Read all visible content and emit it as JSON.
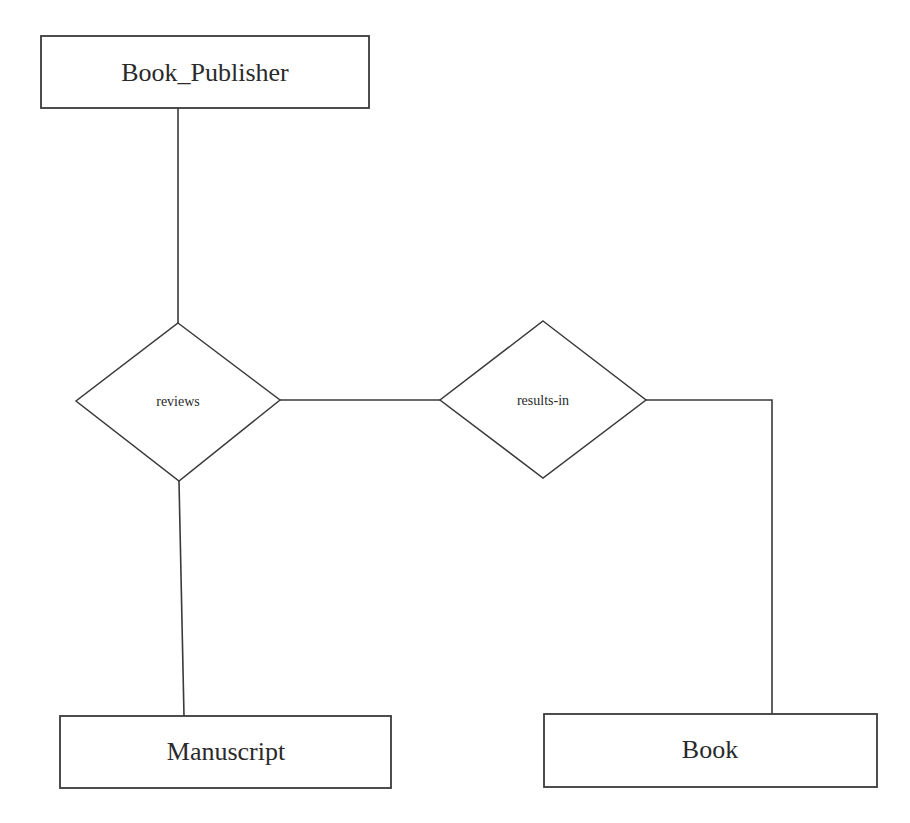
{
  "diagram": {
    "type": "er-diagram",
    "entities": [
      {
        "id": "book_publisher",
        "label": "Book_Publisher"
      },
      {
        "id": "manuscript",
        "label": "Manuscript"
      },
      {
        "id": "book",
        "label": "Book"
      }
    ],
    "relationships": [
      {
        "id": "reviews",
        "label": "reviews"
      },
      {
        "id": "results_in",
        "label": "results-in"
      }
    ],
    "connections": [
      {
        "from": "Book_Publisher",
        "to": "reviews"
      },
      {
        "from": "reviews",
        "to": "Manuscript"
      },
      {
        "from": "reviews",
        "to": "results-in"
      },
      {
        "from": "results-in",
        "to": "Book"
      }
    ],
    "colors": {
      "stroke": "#3a3a3a",
      "text": "#2a2a2a",
      "background": "#ffffff"
    }
  }
}
